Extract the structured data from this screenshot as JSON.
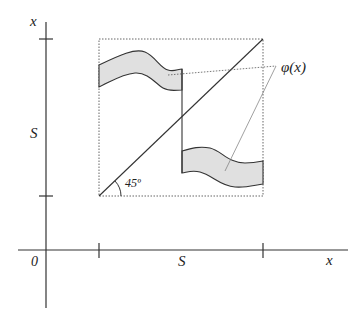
{
  "diagram": {
    "type": "mathematical-graph",
    "labels": {
      "y_axis": "x",
      "x_axis": "x",
      "origin": "0",
      "y_tick": "S",
      "x_tick": "S",
      "angle": "45º",
      "function": "φ(x)"
    },
    "colors": {
      "axis": "#333333",
      "band_fill": "#e0e0e0",
      "band_stroke": "#333333",
      "dotted": "#555555"
    }
  }
}
